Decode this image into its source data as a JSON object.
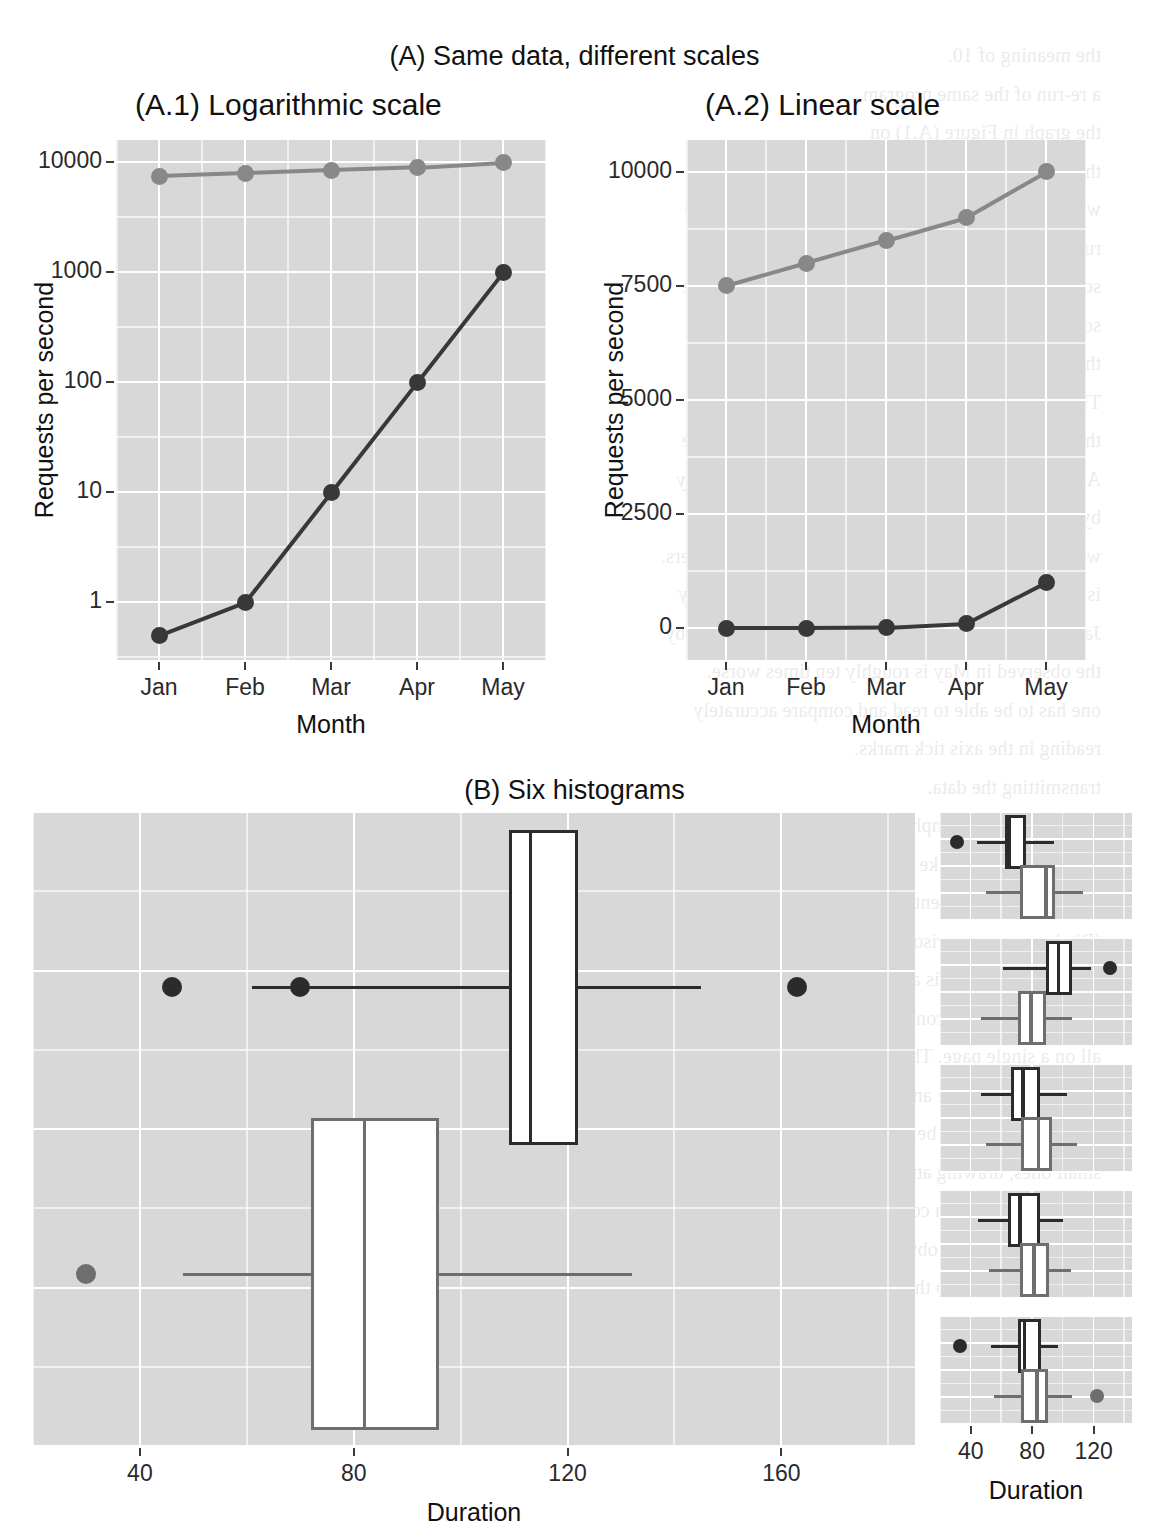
{
  "figure": {
    "panel_a_title": "(A) Same data, different scales",
    "panel_a1_title": "(A.1) Logarithmic scale",
    "panel_a2_title": "(A.2) Linear scale",
    "panel_b_title": "(B) Six histograms"
  },
  "colors": {
    "panel_background": "#d8d8d8",
    "gridline": "#ffffff",
    "series_dark": "#383838",
    "series_grey": "#888888",
    "text": "#111111",
    "page_background": "#ffffff"
  },
  "chart_data": [
    {
      "type": "line",
      "id": "a1-logarithmic",
      "title": "(A.1) Logarithmic scale",
      "xlabel": "Month",
      "ylabel": "Requests per second",
      "categories": [
        "Jan",
        "Feb",
        "Mar",
        "Apr",
        "May"
      ],
      "yscale": "log10",
      "yticks": [
        "1",
        "10",
        "100",
        "1000",
        "10000"
      ],
      "ytick_values": [
        1,
        10,
        100,
        1000,
        10000
      ],
      "ylim": [
        0.3,
        16000
      ],
      "grid": true,
      "legend": "none",
      "series": [
        {
          "name": "grey-series",
          "color": "#888888",
          "values": [
            7500,
            8000,
            8500,
            9000,
            10000
          ]
        },
        {
          "name": "dark-series",
          "color": "#383838",
          "values": [
            0.5,
            1,
            10,
            100,
            1000
          ]
        }
      ]
    },
    {
      "type": "line",
      "id": "a2-linear",
      "title": "(A.2) Linear scale",
      "xlabel": "Month",
      "ylabel": "Requests per second",
      "categories": [
        "Jan",
        "Feb",
        "Mar",
        "Apr",
        "May"
      ],
      "yscale": "linear",
      "yticks": [
        "0",
        "2500",
        "5000",
        "7500",
        "10000"
      ],
      "ytick_values": [
        0,
        2500,
        5000,
        7500,
        10000
      ],
      "ylim": [
        -700,
        10700
      ],
      "grid": true,
      "legend": "none",
      "series": [
        {
          "name": "grey-series",
          "color": "#888888",
          "values": [
            7500,
            8000,
            8500,
            9000,
            10000
          ]
        },
        {
          "name": "dark-series",
          "color": "#383838",
          "values": [
            0.5,
            1,
            10,
            100,
            1000
          ]
        }
      ]
    },
    {
      "type": "boxplot",
      "id": "b-large-boxplots",
      "title": "(B) Six histograms",
      "xlabel": "Duration",
      "xticks": [
        "40",
        "80",
        "120",
        "160"
      ],
      "xtick_values": [
        40,
        80,
        120,
        160
      ],
      "xlim": [
        20,
        185
      ],
      "grid": true,
      "boxes": [
        {
          "name": "dark-box",
          "color": "#2b2b2b",
          "min": 61,
          "q1": 109,
          "median": 113,
          "q3": 122,
          "max": 145,
          "outliers": [
            46,
            70,
            163
          ]
        },
        {
          "name": "grey-box",
          "color": "#6e6e6e",
          "min": 48,
          "q1": 72,
          "median": 82,
          "q3": 96,
          "max": 132,
          "outliers": [
            30
          ]
        }
      ]
    },
    {
      "type": "boxplot-facets",
      "id": "b-small-multiples",
      "xlabel": "Duration",
      "xticks": [
        "40",
        "80",
        "120"
      ],
      "xtick_values": [
        40,
        80,
        120
      ],
      "xlim": [
        20,
        145
      ],
      "grid": true,
      "facets": [
        {
          "name": "facet-1",
          "boxes": [
            {
              "name": "dark-box",
              "color": "#2b2b2b",
              "min": 44,
              "q1": 62,
              "median": 65,
              "q3": 76,
              "max": 94,
              "outliers": [
                31
              ]
            },
            {
              "name": "grey-box",
              "color": "#6e6e6e",
              "min": 50,
              "q1": 72,
              "median": 89,
              "q3": 95,
              "max": 113,
              "outliers": []
            }
          ]
        },
        {
          "name": "facet-2",
          "boxes": [
            {
              "name": "dark-box",
              "color": "#2b2b2b",
              "min": 61,
              "q1": 89,
              "median": 97,
              "q3": 106,
              "max": 118,
              "outliers": [
                131
              ]
            },
            {
              "name": "grey-box",
              "color": "#6e6e6e",
              "min": 47,
              "q1": 71,
              "median": 79,
              "q3": 89,
              "max": 106,
              "outliers": []
            }
          ]
        },
        {
          "name": "facet-3",
          "boxes": [
            {
              "name": "dark-box",
              "color": "#2b2b2b",
              "min": 47,
              "q1": 66,
              "median": 74,
              "q3": 85,
              "max": 103,
              "outliers": []
            },
            {
              "name": "grey-box",
              "color": "#6e6e6e",
              "min": 50,
              "q1": 73,
              "median": 84,
              "q3": 93,
              "max": 109,
              "outliers": []
            }
          ]
        },
        {
          "name": "facet-4",
          "boxes": [
            {
              "name": "dark-box",
              "color": "#2b2b2b",
              "min": 45,
              "q1": 64,
              "median": 72,
              "q3": 85,
              "max": 100,
              "outliers": []
            },
            {
              "name": "grey-box",
              "color": "#6e6e6e",
              "min": 52,
              "q1": 72,
              "median": 81,
              "q3": 91,
              "max": 105,
              "outliers": []
            }
          ]
        },
        {
          "name": "facet-5",
          "boxes": [
            {
              "name": "dark-box",
              "color": "#2b2b2b",
              "min": 53,
              "q1": 71,
              "median": 75,
              "q3": 86,
              "max": 97,
              "outliers": [
                33
              ]
            },
            {
              "name": "grey-box",
              "color": "#6e6e6e",
              "min": 55,
              "q1": 73,
              "median": 83,
              "q3": 90,
              "max": 106,
              "outliers": [
                122
              ]
            }
          ]
        }
      ]
    }
  ],
  "bleed_text": "the meaning of 10. \n a re-run of the same program \n the graph in Figure (A.1) on \n the same data. If we plot it on a linear scale, as in \n we can see that the dark series looks like a flat line \n running up at the very end. It is easy to be misled. \n scale means that the dark series is drawn on a scale \n so that a tenfold increase in throughput occupies \n the same distance everywhere on the axis. \n This is very different from a linear axis, on which \n the larger values dominate and the smaller ones are \n A.2 shows, we cannot see that the values in January \n by comparing the heights of successive points. \n we would also like to be able to read off the numbers. \n is not enough to see that the graph is approximately \n January and April are identical: they are separated by \n the observed in May is roughly ten times worse. \n one has to be able to read and compare accurately \n reading in the axis tick marks. \n transmitting the data. \n the two panels to emphasise the point that the choice \n we are forced to make careful arguments and draw \n the principle is presented in Figure 1. The One True Plot \n (B) shows a comparison of what such a plot \n might be. For us, it is a common situation where we are \n comparing several conditions, and we want to show them \n all on a single page. Thus we are confronted with a side by side \n display and practice and good habits. The key idea is that \n these panels should be exactly the same size as each of the \n small ones, drawing attention to the fact that each panel shows \n a different view of a comparison that the upper box plot may \n not be immediately obvious in a single plot. In practice, \n this is mostly due to the eye being able to compare lengths"
}
